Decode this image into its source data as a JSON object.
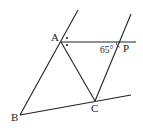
{
  "diagram": {
    "type": "geometry",
    "colors": {
      "line": "#222222",
      "background": "#ffffff"
    },
    "points": {
      "A": {
        "label": "A",
        "x": 61,
        "y": 42
      },
      "B": {
        "label": "B",
        "x": 20,
        "y": 115
      },
      "C": {
        "label": "C",
        "x": 95,
        "y": 101
      },
      "P": {
        "label": "P",
        "x": 122,
        "y": 42
      }
    },
    "angle_label": "65°",
    "labels": {
      "A": "A",
      "B": "B",
      "C": "C",
      "P": "P",
      "angle": "65°",
      "mark_small": "°"
    }
  }
}
